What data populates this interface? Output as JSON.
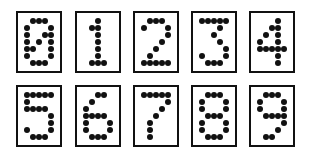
{
  "grid": {
    "cols": 5,
    "rows": 7
  },
  "colors": {
    "ink": "#111111",
    "background": "#ffffff"
  },
  "digits": [
    {
      "label": "0",
      "card": {
        "x": 16,
        "y": 11
      },
      "dots": [
        [
          2,
          1
        ],
        [
          3,
          1
        ],
        [
          4,
          1
        ],
        [
          1,
          2
        ],
        [
          5,
          2
        ],
        [
          1,
          3
        ],
        [
          4,
          3
        ],
        [
          5,
          3
        ],
        [
          1,
          4
        ],
        [
          3,
          4
        ],
        [
          5,
          4
        ],
        [
          1,
          5
        ],
        [
          2,
          5
        ],
        [
          5,
          5
        ],
        [
          1,
          6
        ],
        [
          5,
          6
        ],
        [
          2,
          7
        ],
        [
          3,
          7
        ],
        [
          4,
          7
        ]
      ]
    },
    {
      "label": "1",
      "card": {
        "x": 75,
        "y": 11
      },
      "dots": [
        [
          3,
          1
        ],
        [
          2,
          2
        ],
        [
          3,
          2
        ],
        [
          3,
          3
        ],
        [
          3,
          4
        ],
        [
          3,
          5
        ],
        [
          3,
          6
        ],
        [
          2,
          7
        ],
        [
          3,
          7
        ],
        [
          4,
          7
        ]
      ]
    },
    {
      "label": "2",
      "card": {
        "x": 133,
        "y": 11
      },
      "dots": [
        [
          2,
          1
        ],
        [
          3,
          1
        ],
        [
          4,
          1
        ],
        [
          1,
          2
        ],
        [
          5,
          2
        ],
        [
          5,
          3
        ],
        [
          4,
          4
        ],
        [
          3,
          5
        ],
        [
          2,
          6
        ],
        [
          1,
          7
        ],
        [
          2,
          7
        ],
        [
          3,
          7
        ],
        [
          4,
          7
        ],
        [
          5,
          7
        ]
      ]
    },
    {
      "label": "3",
      "card": {
        "x": 191,
        "y": 11
      },
      "dots": [
        [
          1,
          1
        ],
        [
          2,
          1
        ],
        [
          3,
          1
        ],
        [
          4,
          1
        ],
        [
          5,
          1
        ],
        [
          4,
          2
        ],
        [
          3,
          3
        ],
        [
          4,
          4
        ],
        [
          5,
          5
        ],
        [
          1,
          6
        ],
        [
          5,
          6
        ],
        [
          2,
          7
        ],
        [
          3,
          7
        ],
        [
          4,
          7
        ]
      ]
    },
    {
      "label": "4",
      "card": {
        "x": 249,
        "y": 11
      },
      "dots": [
        [
          4,
          1
        ],
        [
          3,
          2
        ],
        [
          4,
          2
        ],
        [
          2,
          3
        ],
        [
          4,
          3
        ],
        [
          1,
          4
        ],
        [
          4,
          4
        ],
        [
          1,
          5
        ],
        [
          2,
          5
        ],
        [
          3,
          5
        ],
        [
          4,
          5
        ],
        [
          5,
          5
        ],
        [
          4,
          6
        ],
        [
          4,
          7
        ]
      ]
    },
    {
      "label": "5",
      "card": {
        "x": 16,
        "y": 85
      },
      "dots": [
        [
          1,
          1
        ],
        [
          2,
          1
        ],
        [
          3,
          1
        ],
        [
          4,
          1
        ],
        [
          5,
          1
        ],
        [
          1,
          2
        ],
        [
          1,
          3
        ],
        [
          2,
          3
        ],
        [
          3,
          3
        ],
        [
          4,
          3
        ],
        [
          5,
          4
        ],
        [
          5,
          5
        ],
        [
          1,
          6
        ],
        [
          5,
          6
        ],
        [
          2,
          7
        ],
        [
          3,
          7
        ],
        [
          4,
          7
        ]
      ]
    },
    {
      "label": "6",
      "card": {
        "x": 75,
        "y": 85
      },
      "dots": [
        [
          3,
          1
        ],
        [
          4,
          1
        ],
        [
          2,
          2
        ],
        [
          1,
          3
        ],
        [
          1,
          4
        ],
        [
          2,
          4
        ],
        [
          3,
          4
        ],
        [
          4,
          4
        ],
        [
          1,
          5
        ],
        [
          5,
          5
        ],
        [
          1,
          6
        ],
        [
          5,
          6
        ],
        [
          2,
          7
        ],
        [
          3,
          7
        ],
        [
          4,
          7
        ]
      ]
    },
    {
      "label": "7",
      "card": {
        "x": 133,
        "y": 85
      },
      "dots": [
        [
          1,
          1
        ],
        [
          2,
          1
        ],
        [
          3,
          1
        ],
        [
          4,
          1
        ],
        [
          5,
          1
        ],
        [
          5,
          2
        ],
        [
          4,
          3
        ],
        [
          3,
          4
        ],
        [
          2,
          5
        ],
        [
          2,
          6
        ],
        [
          2,
          7
        ]
      ]
    },
    {
      "label": "8",
      "card": {
        "x": 191,
        "y": 85
      },
      "dots": [
        [
          2,
          1
        ],
        [
          3,
          1
        ],
        [
          4,
          1
        ],
        [
          1,
          2
        ],
        [
          5,
          2
        ],
        [
          1,
          3
        ],
        [
          5,
          3
        ],
        [
          2,
          4
        ],
        [
          3,
          4
        ],
        [
          4,
          4
        ],
        [
          1,
          5
        ],
        [
          5,
          5
        ],
        [
          1,
          6
        ],
        [
          5,
          6
        ],
        [
          2,
          7
        ],
        [
          3,
          7
        ],
        [
          4,
          7
        ]
      ]
    },
    {
      "label": "9",
      "card": {
        "x": 249,
        "y": 85
      },
      "dots": [
        [
          2,
          1
        ],
        [
          3,
          1
        ],
        [
          4,
          1
        ],
        [
          1,
          2
        ],
        [
          5,
          2
        ],
        [
          1,
          3
        ],
        [
          5,
          3
        ],
        [
          2,
          4
        ],
        [
          3,
          4
        ],
        [
          4,
          4
        ],
        [
          5,
          4
        ],
        [
          5,
          5
        ],
        [
          4,
          6
        ],
        [
          2,
          7
        ],
        [
          3,
          7
        ]
      ]
    }
  ]
}
